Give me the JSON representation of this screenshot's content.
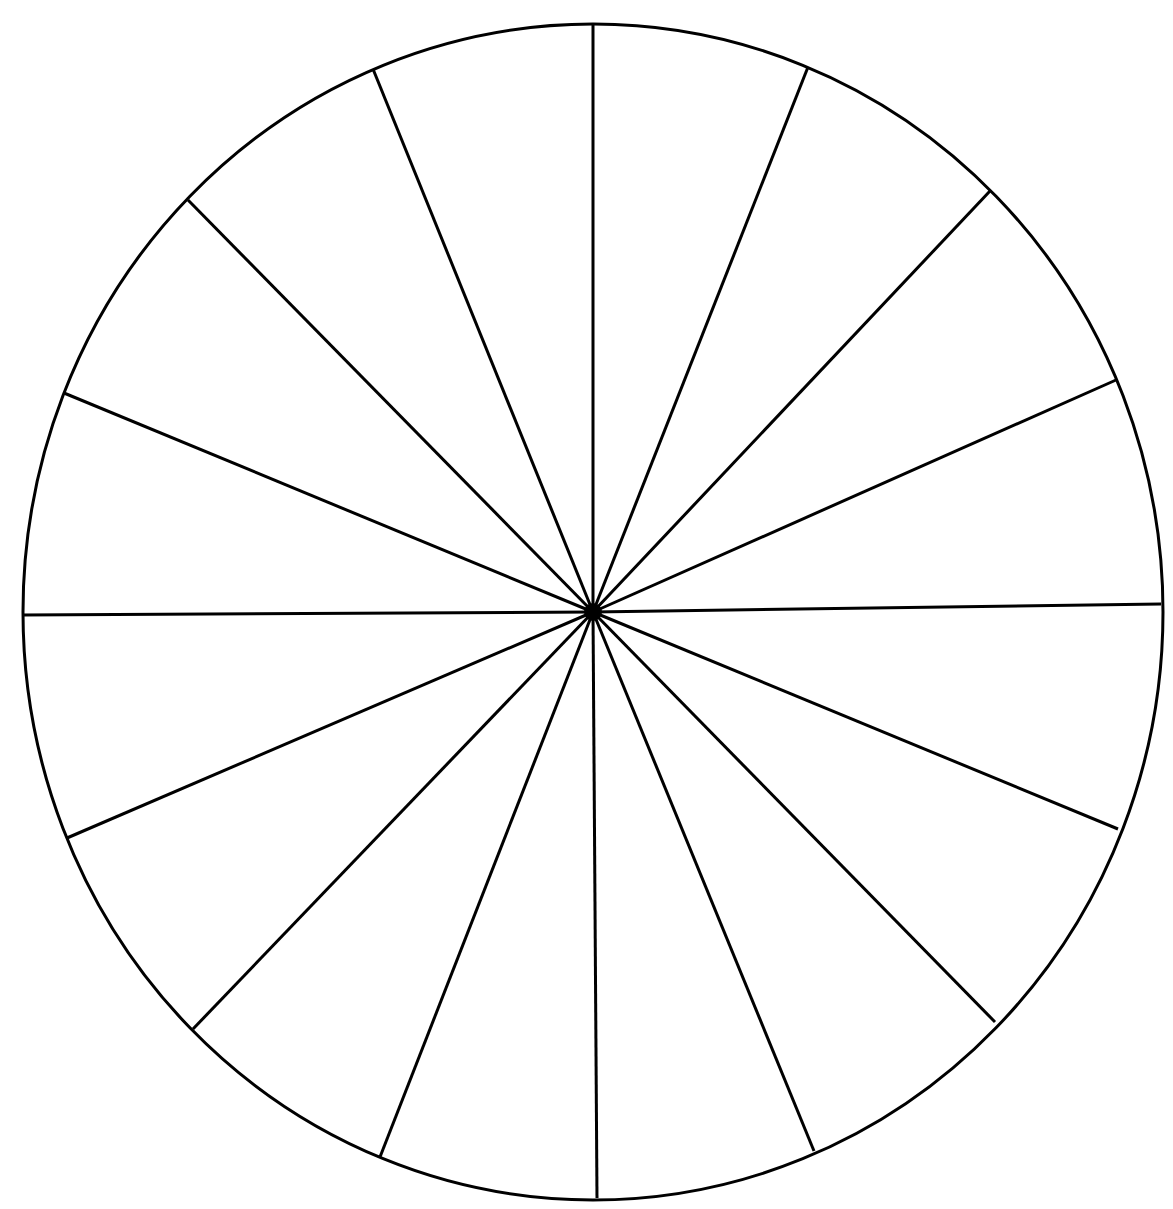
{
  "diagram": {
    "type": "segmented-circle",
    "segments": 16,
    "stroke_color": "#000000",
    "fill_color": "#ffffff",
    "center": [
      593,
      612
    ],
    "radius_x": 570,
    "radius_y": 588,
    "spoke_endpoints": [
      [
        593,
        23
      ],
      [
        808,
        67
      ],
      [
        990,
        191
      ],
      [
        1116,
        380
      ],
      [
        1161,
        604
      ],
      [
        1118,
        829
      ],
      [
        995,
        1022
      ],
      [
        814,
        1151
      ],
      [
        597,
        1198
      ],
      [
        380,
        1157
      ],
      [
        193,
        1029
      ],
      [
        67,
        838
      ],
      [
        22,
        615
      ],
      [
        64,
        393
      ],
      [
        188,
        200
      ],
      [
        373,
        69
      ]
    ]
  }
}
